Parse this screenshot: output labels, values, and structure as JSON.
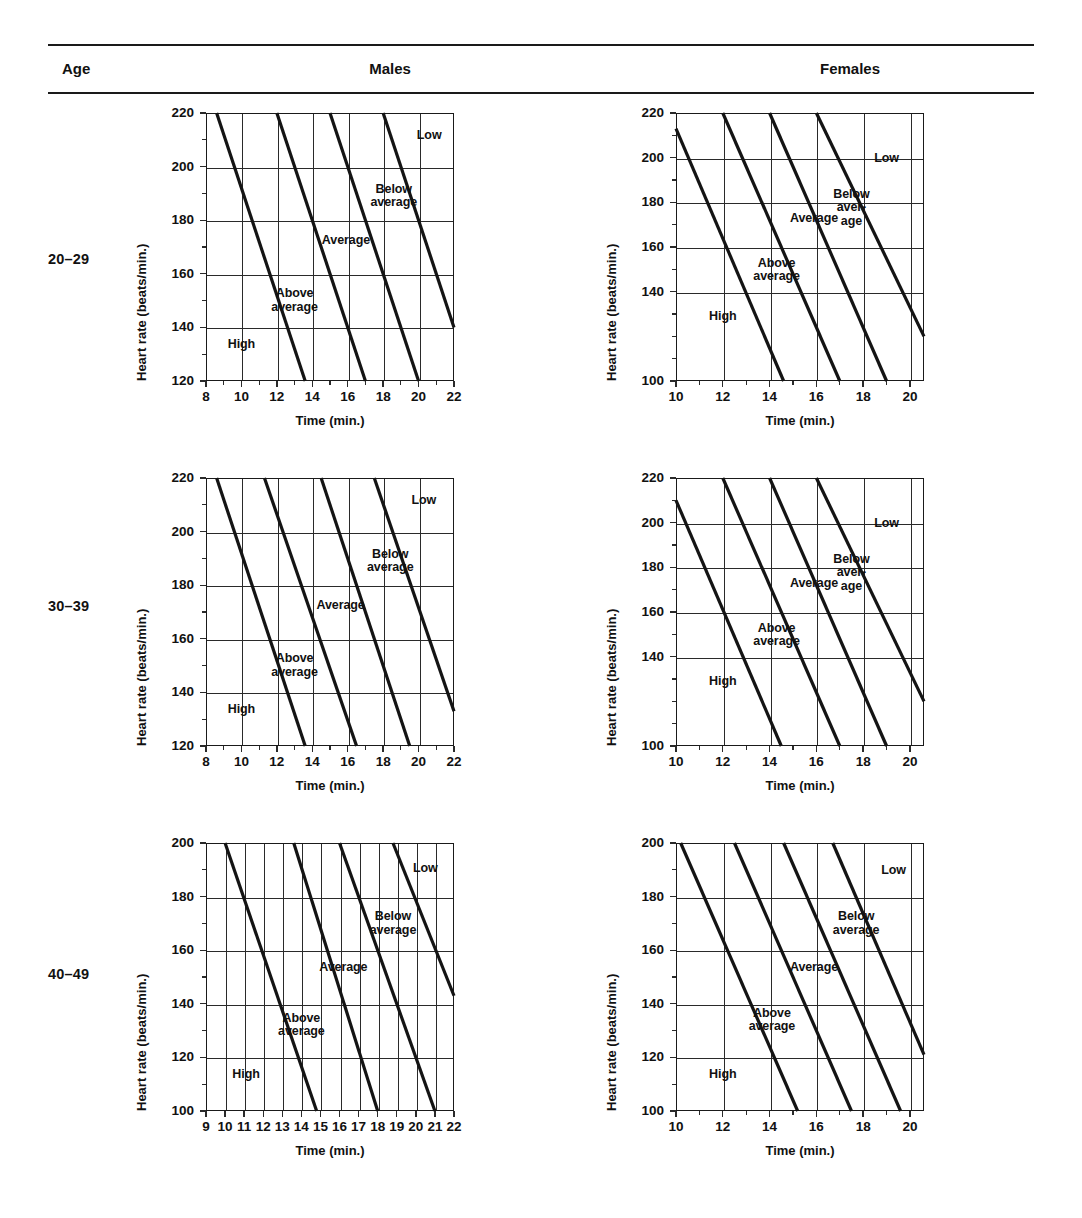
{
  "header": {
    "age_label": "Age",
    "males_label": "Males",
    "females_label": "Females"
  },
  "rows": [
    {
      "age": "20–29"
    },
    {
      "age": "30–39"
    },
    {
      "age": "40–49"
    }
  ],
  "axis_titles": {
    "y": "Heart rate (beats/min.)",
    "x": "Time (min.)"
  },
  "zone_labels": {
    "high": "High",
    "above_average": "Above\naverage",
    "average": "Average",
    "below_average": "Below\naverage",
    "below_average_hyphen": "Below\naver-\nage",
    "low": "Low"
  },
  "chart_data": [
    {
      "id": "males-20-29",
      "type": "line",
      "title": "Males 20–29",
      "xlabel": "Time (min.)",
      "ylabel": "Heart rate (beats/min.)",
      "xlim": [
        8,
        22
      ],
      "ylim": [
        120,
        220
      ],
      "xticks": [
        8,
        10,
        12,
        14,
        16,
        18,
        20,
        22
      ],
      "xminor": [
        9,
        11,
        13,
        15,
        17,
        19,
        21
      ],
      "yticks": [
        120,
        140,
        160,
        180,
        200,
        220
      ],
      "yminor": [
        130,
        150,
        170,
        190,
        210
      ],
      "grid": true,
      "zones": [
        "High",
        "Above average",
        "Average",
        "Below average",
        "Low"
      ],
      "series": [
        {
          "name": "High / Above average boundary",
          "points": [
            [
              8.6,
              220
            ],
            [
              13.6,
              120
            ]
          ]
        },
        {
          "name": "Above average / Average boundary",
          "points": [
            [
              12.0,
              220
            ],
            [
              17.0,
              120
            ]
          ]
        },
        {
          "name": "Average / Below average boundary",
          "points": [
            [
              15.0,
              220
            ],
            [
              20.0,
              120
            ]
          ]
        },
        {
          "name": "Below average / Low boundary",
          "points": [
            [
              18.0,
              220
            ],
            [
              22.0,
              140
            ]
          ]
        }
      ],
      "zone_label_pos": [
        {
          "text": "High",
          "x": 10.0,
          "y": 133
        },
        {
          "text": "Above\naverage",
          "x": 13.0,
          "y": 152
        },
        {
          "text": "Average",
          "x": 15.9,
          "y": 172
        },
        {
          "text": "Below\naverage",
          "x": 18.6,
          "y": 191
        },
        {
          "text": "Low",
          "x": 20.6,
          "y": 211
        }
      ]
    },
    {
      "id": "females-20-29",
      "type": "line",
      "title": "Females 20–29",
      "xlabel": "Time (min.)",
      "ylabel": "Heart rate (beats/min.)",
      "xlim": [
        10,
        20.6
      ],
      "ylim": [
        100,
        220
      ],
      "xticks": [
        10,
        12,
        14,
        16,
        18,
        20
      ],
      "xminor": [
        11,
        13,
        15,
        17,
        19
      ],
      "yticks": [
        100,
        140,
        160,
        180,
        200,
        220
      ],
      "yminor": [
        110,
        120,
        130,
        150,
        170,
        190,
        210
      ],
      "grid": true,
      "zones": [
        "High",
        "Above average",
        "Average",
        "Below average",
        "Low"
      ],
      "series": [
        {
          "name": "High / Above average boundary",
          "points": [
            [
              10.0,
              213
            ],
            [
              14.6,
              100
            ]
          ]
        },
        {
          "name": "Above average / Average boundary",
          "points": [
            [
              12.0,
              220
            ],
            [
              17.0,
              100
            ]
          ]
        },
        {
          "name": "Average / Below average boundary",
          "points": [
            [
              14.0,
              220
            ],
            [
              19.0,
              100
            ]
          ]
        },
        {
          "name": "Below average / Low boundary",
          "points": [
            [
              16.0,
              220
            ],
            [
              20.6,
              120
            ]
          ]
        }
      ],
      "zone_label_pos": [
        {
          "text": "High",
          "x": 12.0,
          "y": 128
        },
        {
          "text": "Above\naverage",
          "x": 14.3,
          "y": 152
        },
        {
          "text": "Average",
          "x": 15.9,
          "y": 172
        },
        {
          "text": "Below\naver-\nage",
          "x": 17.5,
          "y": 183
        },
        {
          "text": "Low",
          "x": 19.0,
          "y": 199
        }
      ]
    },
    {
      "id": "males-30-39",
      "type": "line",
      "title": "Males 30–39",
      "xlabel": "Time (min.)",
      "ylabel": "Heart rate (beats/min.)",
      "xlim": [
        8,
        22
      ],
      "ylim": [
        120,
        220
      ],
      "xticks": [
        8,
        10,
        12,
        14,
        16,
        18,
        20,
        22
      ],
      "xminor": [
        9,
        11,
        13,
        15,
        17,
        19,
        21
      ],
      "yticks": [
        120,
        140,
        160,
        180,
        200,
        220
      ],
      "yminor": [
        130,
        150,
        170,
        190,
        210
      ],
      "grid": true,
      "zones": [
        "High",
        "Above average",
        "Average",
        "Below average",
        "Low"
      ],
      "series": [
        {
          "name": "High / Above average boundary",
          "points": [
            [
              8.6,
              220
            ],
            [
              13.6,
              120
            ]
          ]
        },
        {
          "name": "Above average / Average boundary",
          "points": [
            [
              11.3,
              220
            ],
            [
              16.5,
              120
            ]
          ]
        },
        {
          "name": "Average / Below average boundary",
          "points": [
            [
              14.5,
              220
            ],
            [
              19.5,
              120
            ]
          ]
        },
        {
          "name": "Below average / Low boundary",
          "points": [
            [
              17.5,
              220
            ],
            [
              22.0,
              133
            ]
          ]
        }
      ],
      "zone_label_pos": [
        {
          "text": "High",
          "x": 10.0,
          "y": 133
        },
        {
          "text": "Above\naverage",
          "x": 13.0,
          "y": 152
        },
        {
          "text": "Average",
          "x": 15.6,
          "y": 172
        },
        {
          "text": "Below\naverage",
          "x": 18.4,
          "y": 191
        },
        {
          "text": "Low",
          "x": 20.3,
          "y": 211
        }
      ]
    },
    {
      "id": "females-30-39",
      "type": "line",
      "title": "Females 30–39",
      "xlabel": "Time (min.)",
      "ylabel": "Heart rate (beats/min.)",
      "xlim": [
        10,
        20.6
      ],
      "ylim": [
        100,
        220
      ],
      "xticks": [
        10,
        12,
        14,
        16,
        18,
        20
      ],
      "xminor": [
        11,
        13,
        15,
        17,
        19
      ],
      "yticks": [
        100,
        140,
        160,
        180,
        200,
        220
      ],
      "yminor": [
        110,
        120,
        130,
        150,
        170,
        190,
        210
      ],
      "grid": true,
      "zones": [
        "High",
        "Above average",
        "Average",
        "Below average",
        "Low"
      ],
      "series": [
        {
          "name": "High / Above average boundary",
          "points": [
            [
              10.0,
              210
            ],
            [
              14.5,
              100
            ]
          ]
        },
        {
          "name": "Above average / Average boundary",
          "points": [
            [
              12.0,
              220
            ],
            [
              17.0,
              100
            ]
          ]
        },
        {
          "name": "Average / Below average boundary",
          "points": [
            [
              14.0,
              220
            ],
            [
              19.0,
              100
            ]
          ]
        },
        {
          "name": "Below average / Low boundary",
          "points": [
            [
              16.0,
              220
            ],
            [
              20.6,
              120
            ]
          ]
        }
      ],
      "zone_label_pos": [
        {
          "text": "High",
          "x": 12.0,
          "y": 128
        },
        {
          "text": "Above\naverage",
          "x": 14.3,
          "y": 152
        },
        {
          "text": "Average",
          "x": 15.9,
          "y": 172
        },
        {
          "text": "Below\naver-\nage",
          "x": 17.5,
          "y": 183
        },
        {
          "text": "Low",
          "x": 19.0,
          "y": 199
        }
      ]
    },
    {
      "id": "males-40-49",
      "type": "line",
      "title": "Males 40–49",
      "xlabel": "Time (min.)",
      "ylabel": "Heart rate (beats/min.)",
      "xlim": [
        9,
        22
      ],
      "ylim": [
        100,
        200
      ],
      "xticks": [
        9,
        10,
        11,
        12,
        13,
        14,
        15,
        16,
        17,
        18,
        19,
        20,
        21,
        22
      ],
      "xminor": [],
      "yticks": [
        100,
        120,
        140,
        160,
        180,
        200
      ],
      "yminor": [
        110,
        130,
        150,
        170,
        190
      ],
      "grid": true,
      "zones": [
        "High",
        "Above average",
        "Average",
        "Below average",
        "Low"
      ],
      "series": [
        {
          "name": "High / Above average boundary",
          "points": [
            [
              10.0,
              200
            ],
            [
              14.8,
              100
            ]
          ]
        },
        {
          "name": "Above average / Average boundary",
          "points": [
            [
              13.6,
              200
            ],
            [
              18.0,
              100
            ]
          ]
        },
        {
          "name": "Average / Below average boundary",
          "points": [
            [
              16.0,
              200
            ],
            [
              21.0,
              100
            ]
          ]
        },
        {
          "name": "Below average / Low boundary",
          "points": [
            [
              18.8,
              200
            ],
            [
              22.0,
              143
            ]
          ]
        }
      ],
      "zone_label_pos": [
        {
          "text": "High",
          "x": 11.1,
          "y": 113
        },
        {
          "text": "Above\naverage",
          "x": 14.0,
          "y": 134
        },
        {
          "text": "Average",
          "x": 16.2,
          "y": 153
        },
        {
          "text": "Below\naverage",
          "x": 18.8,
          "y": 172
        },
        {
          "text": "Low",
          "x": 20.5,
          "y": 190
        }
      ]
    },
    {
      "id": "females-40-49",
      "type": "line",
      "title": "Females 40–49",
      "xlabel": "Time (min.)",
      "ylabel": "Heart rate (beats/min.)",
      "xlim": [
        10,
        20.6
      ],
      "ylim": [
        100,
        200
      ],
      "xticks": [
        10,
        12,
        14,
        16,
        18,
        20
      ],
      "xminor": [
        11,
        13,
        15,
        17,
        19
      ],
      "yticks": [
        100,
        120,
        140,
        160,
        180,
        200
      ],
      "yminor": [
        110,
        130,
        150,
        170,
        190
      ],
      "grid": true,
      "zones": [
        "High",
        "Above average",
        "Average",
        "Below average",
        "Low"
      ],
      "series": [
        {
          "name": "High / Above average boundary",
          "points": [
            [
              10.2,
              200
            ],
            [
              15.2,
              100
            ]
          ]
        },
        {
          "name": "Above average / Average boundary",
          "points": [
            [
              12.5,
              200
            ],
            [
              17.5,
              100
            ]
          ]
        },
        {
          "name": "Average / Below average boundary",
          "points": [
            [
              14.6,
              200
            ],
            [
              19.6,
              100
            ]
          ]
        },
        {
          "name": "Below average / Low boundary",
          "points": [
            [
              16.7,
              200
            ],
            [
              20.6,
              121
            ]
          ]
        }
      ],
      "zone_label_pos": [
        {
          "text": "High",
          "x": 12.0,
          "y": 113
        },
        {
          "text": "Above\naverage",
          "x": 14.1,
          "y": 136
        },
        {
          "text": "Average",
          "x": 15.9,
          "y": 153
        },
        {
          "text": "Below\naverage",
          "x": 17.7,
          "y": 172
        },
        {
          "text": "Low",
          "x": 19.3,
          "y": 189
        }
      ]
    }
  ]
}
